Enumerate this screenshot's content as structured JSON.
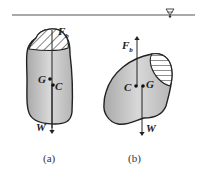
{
  "figure": {
    "water_surface_symbol": "triangle-down-icon",
    "panels": [
      {
        "id": "a",
        "caption": "(a)",
        "buoyancy_label": "F",
        "buoyancy_subscript": "b",
        "center_of_gravity_label": "G",
        "center_of_buoyancy_label": "C",
        "weight_label": "W"
      },
      {
        "id": "b",
        "caption": "(b)",
        "buoyancy_label": "F",
        "buoyancy_subscript": "b",
        "center_of_gravity_label": "G",
        "center_of_buoyancy_label": "C",
        "weight_label": "W"
      }
    ]
  },
  "colors": {
    "body_fill": "#c8c8c8",
    "outline": "#222222",
    "water_line": "#555555"
  }
}
